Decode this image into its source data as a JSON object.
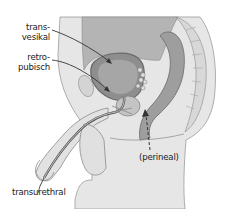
{
  "diagram": {
    "labels": {
      "transvesikal_line1": "trans-",
      "transvesikal_line2": "vesikal",
      "retropubisch_line1": "retro-",
      "retropubisch_line2": "pubisch",
      "transurethral": "transurethral",
      "perineal": "(perineal)"
    },
    "colors": {
      "background": "#ffffff",
      "body_fill": "#e6e6e6",
      "tissue_fill": "#d2d2d2",
      "organ_fill": "#a8a8a8",
      "organ_dark": "#8e8e8e",
      "outline": "#6a6a6a",
      "text": "#222222",
      "arrow": "#333333"
    }
  }
}
